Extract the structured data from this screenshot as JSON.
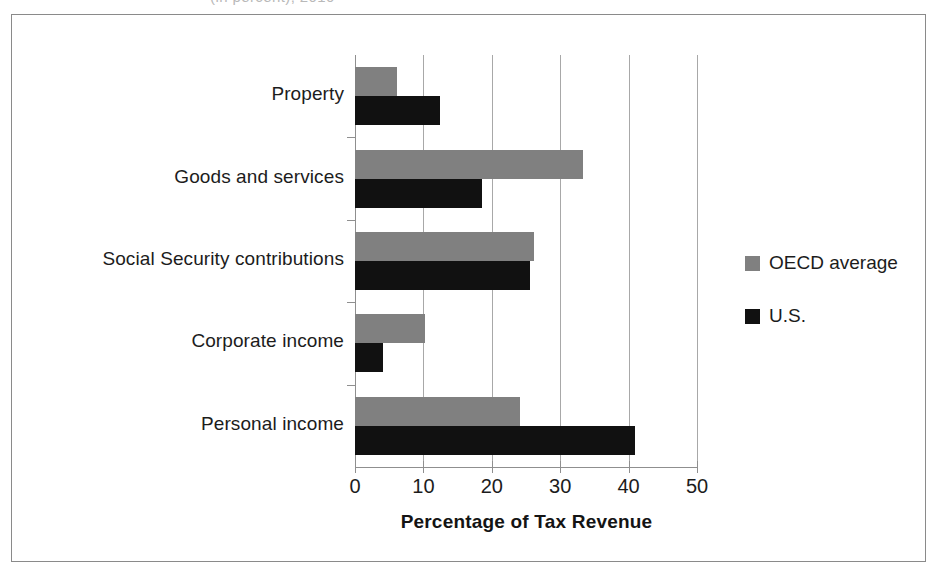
{
  "artifact": {
    "top_cut_text": "(in percent), 2010"
  },
  "chart_data": {
    "type": "bar",
    "orientation": "horizontal",
    "title": "",
    "xlabel": "Percentage of Tax Revenue",
    "ylabel": "",
    "xlim": [
      0,
      50
    ],
    "xticks": [
      0,
      10,
      20,
      30,
      40,
      50
    ],
    "xtick_labels": [
      "0",
      "10",
      "20",
      "30",
      "40",
      "50"
    ],
    "grid": true,
    "grid_axis": "x",
    "legend_position": "right",
    "categories": [
      "Property",
      "Goods and services",
      "Social Security contributions",
      "Corporate income",
      "Personal income"
    ],
    "series": [
      {
        "name": "OECD average",
        "color": "#808080",
        "values": [
          6.2,
          33.4,
          26.2,
          10.3,
          24.1
        ]
      },
      {
        "name": "U.S.",
        "color": "#111111",
        "values": [
          12.4,
          18.5,
          25.6,
          4.1,
          41.0
        ]
      }
    ]
  },
  "legend": {
    "items": [
      {
        "label": "OECD average",
        "color": "#808080"
      },
      {
        "label": "U.S.",
        "color": "#111111"
      }
    ]
  }
}
